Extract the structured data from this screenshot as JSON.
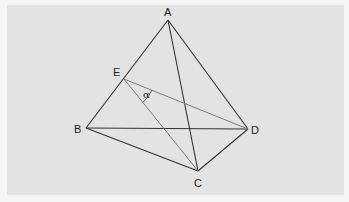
{
  "diagram": {
    "type": "tetrahedron",
    "vertices": [
      {
        "id": "A",
        "label": "A"
      },
      {
        "id": "B",
        "label": "B"
      },
      {
        "id": "C",
        "label": "C"
      },
      {
        "id": "D",
        "label": "D"
      },
      {
        "id": "E",
        "label": "E",
        "note": "point on edge AB"
      }
    ],
    "edges": [
      {
        "from": "A",
        "to": "B",
        "style": "main"
      },
      {
        "from": "A",
        "to": "D",
        "style": "main"
      },
      {
        "from": "A",
        "to": "C",
        "style": "main"
      },
      {
        "from": "B",
        "to": "D",
        "style": "main"
      },
      {
        "from": "B",
        "to": "C",
        "style": "main"
      },
      {
        "from": "C",
        "to": "D",
        "style": "main"
      },
      {
        "from": "E",
        "to": "D",
        "style": "light"
      },
      {
        "from": "E",
        "to": "C",
        "style": "light"
      }
    ],
    "angle": {
      "vertex": "E",
      "between": [
        "C",
        "D"
      ],
      "label": "α"
    }
  }
}
